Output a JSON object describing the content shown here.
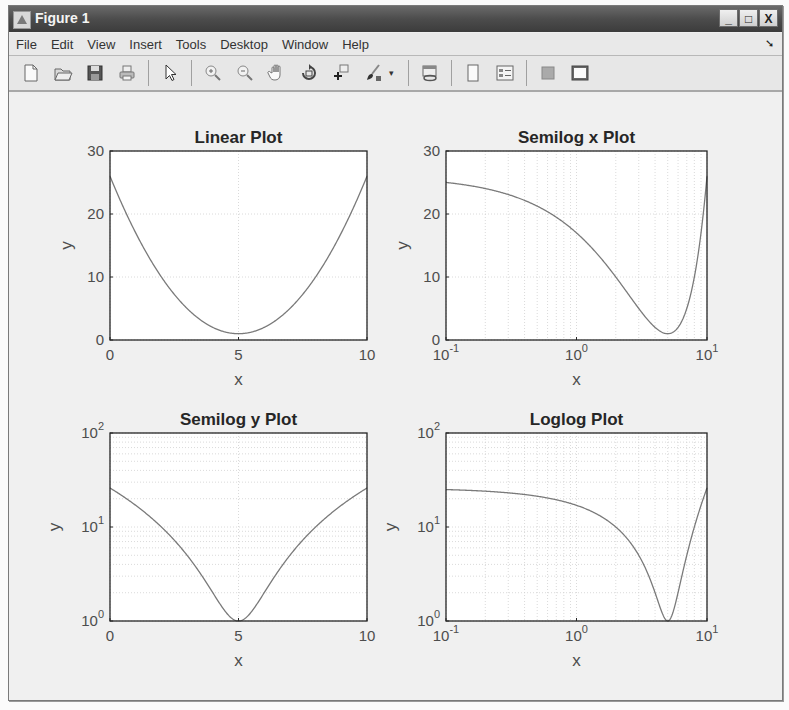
{
  "window": {
    "title": "Figure 1",
    "controls": {
      "minimize": "_",
      "maximize": "□",
      "close": "X"
    }
  },
  "menubar": {
    "items": [
      "File",
      "Edit",
      "View",
      "Insert",
      "Tools",
      "Desktop",
      "Window",
      "Help"
    ],
    "dock_arrow": "➘"
  },
  "toolbar": {
    "buttons": [
      {
        "name": "new-figure",
        "icon": "new-file-icon"
      },
      {
        "name": "open-file",
        "icon": "open-folder-icon"
      },
      {
        "name": "save-figure",
        "icon": "save-disk-icon"
      },
      {
        "name": "print-figure",
        "icon": "printer-icon"
      },
      {
        "name": "edit-plot",
        "icon": "arrow-cursor-icon"
      },
      {
        "name": "zoom-in",
        "icon": "zoom-in-icon"
      },
      {
        "name": "zoom-out",
        "icon": "zoom-out-icon"
      },
      {
        "name": "pan",
        "icon": "hand-icon"
      },
      {
        "name": "rotate-3d",
        "icon": "rotate-icon"
      },
      {
        "name": "data-cursor",
        "icon": "data-cursor-icon"
      },
      {
        "name": "brush",
        "icon": "brush-icon"
      },
      {
        "name": "link-plot",
        "icon": "link-plot-icon"
      },
      {
        "name": "insert-colorbar",
        "icon": "colorbar-icon"
      },
      {
        "name": "insert-legend",
        "icon": "legend-icon"
      },
      {
        "name": "hide-plot-tools",
        "icon": "hide-tools-icon"
      },
      {
        "name": "show-plot-tools",
        "icon": "show-tools-icon"
      }
    ],
    "brush_dropdown": "▾"
  },
  "colors": {
    "line": "#7a7a7a",
    "axes": "#262626",
    "grid": "#d0d0d0",
    "plot_bg": "#ffffff",
    "figure_bg": "#f0f0f0"
  },
  "chart_data": [
    {
      "type": "line",
      "title": "Linear Plot",
      "xlabel": "x",
      "ylabel": "y",
      "xscale": "linear",
      "yscale": "linear",
      "xlim": [
        0,
        10
      ],
      "ylim": [
        0,
        30
      ],
      "xticks": [
        "0",
        "5",
        "10"
      ],
      "yticks": [
        "0",
        "10",
        "20",
        "30"
      ],
      "grid": true,
      "function": "y = (x-5)^2 + 1",
      "x": [
        0,
        1,
        2,
        3,
        4,
        5,
        6,
        7,
        8,
        9,
        10
      ],
      "y": [
        26,
        17,
        10,
        5,
        2,
        1,
        2,
        5,
        10,
        17,
        26
      ]
    },
    {
      "type": "line",
      "title": "Semilog x Plot",
      "xlabel": "x",
      "ylabel": "y",
      "xscale": "log",
      "yscale": "linear",
      "xlim": [
        0.1,
        10
      ],
      "ylim": [
        0,
        30
      ],
      "xticks": [
        "10^-1",
        "10^0",
        "10^1"
      ],
      "yticks": [
        "0",
        "10",
        "20",
        "30"
      ],
      "grid": true,
      "function": "y = (x-5)^2 + 1",
      "x": [
        0.1,
        0.2,
        0.5,
        1,
        2,
        3,
        4,
        5,
        6,
        7,
        8,
        9,
        10
      ],
      "y": [
        25.01,
        24.04,
        21.25,
        17,
        10,
        5,
        2,
        1,
        2,
        5,
        10,
        17,
        26
      ]
    },
    {
      "type": "line",
      "title": "Semilog y Plot",
      "xlabel": "x",
      "ylabel": "y",
      "xscale": "linear",
      "yscale": "log",
      "xlim": [
        0,
        10
      ],
      "ylim": [
        1,
        100
      ],
      "xticks": [
        "0",
        "5",
        "10"
      ],
      "yticks": [
        "10^0",
        "10^1",
        "10^2"
      ],
      "grid": true,
      "function": "y = (x-5)^2 + 1",
      "x": [
        0,
        1,
        2,
        3,
        4,
        5,
        6,
        7,
        8,
        9,
        10
      ],
      "y": [
        26,
        17,
        10,
        5,
        2,
        1,
        2,
        5,
        10,
        17,
        26
      ]
    },
    {
      "type": "line",
      "title": "Loglog Plot",
      "xlabel": "x",
      "ylabel": "y",
      "xscale": "log",
      "yscale": "log",
      "xlim": [
        0.1,
        10
      ],
      "ylim": [
        1,
        100
      ],
      "xticks": [
        "10^-1",
        "10^0",
        "10^1"
      ],
      "yticks": [
        "10^0",
        "10^1",
        "10^2"
      ],
      "grid": true,
      "function": "y = (x-5)^2 + 1",
      "x": [
        0.1,
        0.2,
        0.5,
        1,
        2,
        3,
        4,
        5,
        6,
        7,
        8,
        9,
        10
      ],
      "y": [
        25.01,
        24.04,
        21.25,
        17,
        10,
        5,
        2,
        1,
        2,
        5,
        10,
        17,
        26
      ]
    }
  ]
}
